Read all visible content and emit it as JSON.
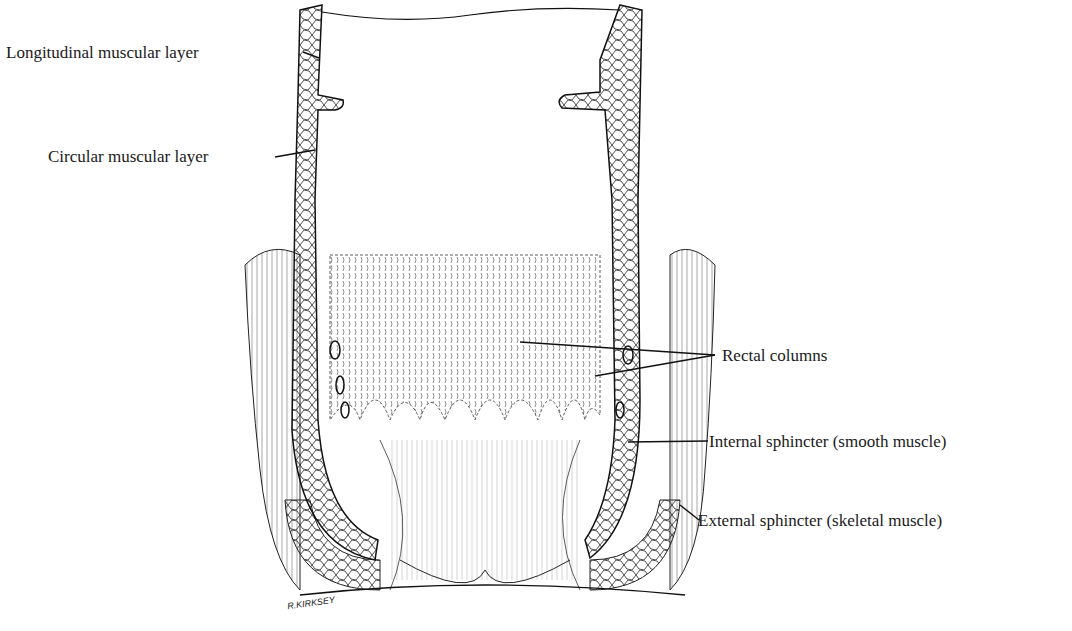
{
  "figure": {
    "labels": [
      {
        "id": "longitudinal",
        "text": "Longitudinal muscular layer"
      },
      {
        "id": "circular",
        "text": "Circular muscular layer"
      },
      {
        "id": "rectal_columns",
        "text": "Rectal columns"
      },
      {
        "id": "internal_sphincter",
        "text": "Internal sphincter (smooth muscle)"
      },
      {
        "id": "external_sphincter",
        "text": "External sphincter (skeletal muscle)"
      }
    ],
    "signature": "R.KIRKSEY"
  }
}
